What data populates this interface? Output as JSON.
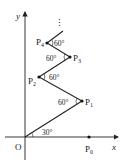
{
  "diagram": {
    "type": "geometry",
    "axes": {
      "x_label": "x",
      "y_label": "y",
      "origin_label": "O"
    },
    "points": [
      {
        "name": "P0",
        "label": "P",
        "sub": "0",
        "x": 89,
        "y": 137
      },
      {
        "name": "P1",
        "label": "P",
        "sub": "1",
        "x": 82,
        "y": 101
      },
      {
        "name": "P2",
        "label": "P",
        "sub": "2",
        "x": 39,
        "y": 77
      },
      {
        "name": "P3",
        "label": "P",
        "sub": "3",
        "x": 70,
        "y": 57
      },
      {
        "name": "P4",
        "label": "P",
        "sub": "4",
        "x": 47,
        "y": 43
      }
    ],
    "angles": [
      {
        "at": "O",
        "label": "30°"
      },
      {
        "at": "P1",
        "label": "60°"
      },
      {
        "at": "P2",
        "label": "60°"
      },
      {
        "at": "P3",
        "label": "60°"
      },
      {
        "at": "P4",
        "label": "60°"
      }
    ],
    "continuation": "⋮",
    "colors": {
      "line": "#222222",
      "point": "#111111"
    }
  }
}
